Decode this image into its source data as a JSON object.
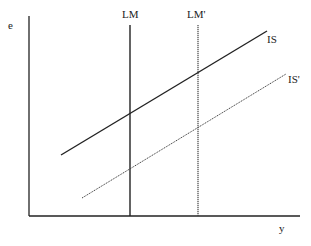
{
  "diagram": {
    "type": "IS-LM",
    "axes": {
      "y_label": "e",
      "x_label": "y"
    },
    "curves": [
      {
        "label": "LM",
        "style": "solid",
        "orientation": "vertical"
      },
      {
        "label": "LM'",
        "style": "dotted",
        "orientation": "vertical"
      },
      {
        "label": "IS",
        "style": "solid",
        "orientation": "upward-sloping"
      },
      {
        "label": "IS'",
        "style": "dotted",
        "orientation": "upward-sloping"
      }
    ]
  }
}
